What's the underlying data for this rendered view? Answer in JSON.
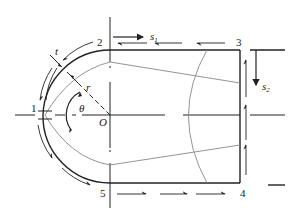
{
  "diagram": {
    "point_labels": {
      "p1": "1",
      "p2": "2",
      "p3": "3",
      "p4": "4",
      "p5": "5",
      "origin": "O"
    },
    "symbol_labels": {
      "thickness": "t",
      "radius": "r",
      "angle": "θ",
      "s1_base": "s",
      "s1_sub": "1",
      "s2_base": "s",
      "s2_sub": "2"
    },
    "colors": {
      "line": "#222222",
      "thin_line": "#888888"
    }
  }
}
